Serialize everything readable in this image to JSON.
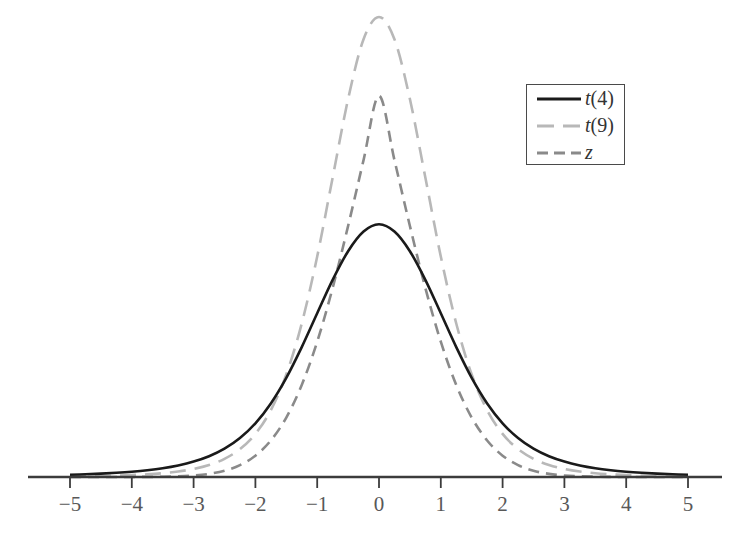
{
  "figure": {
    "background_color": "#ffffff",
    "width": 756,
    "height": 538
  },
  "axis": {
    "baseline_y": 477,
    "line_start_x": 28,
    "line_end_x": 722,
    "color": "#3c3c3c",
    "tick_length": 11,
    "tick_labels": [
      "−5",
      "−4",
      "−3",
      "−2",
      "−1",
      "0",
      "1",
      "2",
      "3",
      "4",
      "5"
    ],
    "tick_values": [
      -5,
      -4,
      -3,
      -2,
      -1,
      0,
      1,
      2,
      3,
      4,
      5
    ],
    "label_color": "#585858"
  },
  "legend": {
    "position": "upper-right",
    "border_color": "#4a4a4a",
    "entries": [
      {
        "label_main": "t",
        "label_paren": "(4)",
        "name": "t-4",
        "color": "#1a1a1a",
        "style": "solid",
        "width": 2.6
      },
      {
        "label_main": "t",
        "label_paren": "(9)",
        "name": "t-9",
        "color": "#b8b8b8",
        "style": "dashed-long",
        "width": 2.6
      },
      {
        "label_main": "z",
        "label_paren": "",
        "name": "z",
        "color": "#8a8a8a",
        "style": "dashed-short",
        "width": 2.6
      }
    ]
  },
  "chart_data": {
    "type": "line",
    "title": "",
    "subtitle": "",
    "xlabel": "",
    "ylabel": "",
    "xlim": [
      -5,
      5
    ],
    "ylim": [
      0,
      0.42
    ],
    "grid": false,
    "legend_position": "upper right",
    "x_tick_labels": [
      "−5",
      "−4",
      "−3",
      "−2",
      "−1",
      "0",
      "1",
      "2",
      "3",
      "4",
      "5"
    ],
    "x": [
      -5,
      -4.75,
      -4.5,
      -4.25,
      -4,
      -3.75,
      -3.5,
      -3.25,
      -3,
      -2.75,
      -2.5,
      -2.25,
      -2,
      -1.75,
      -1.5,
      -1.25,
      -1,
      -0.75,
      -0.5,
      -0.25,
      0,
      0.25,
      0.5,
      0.75,
      1,
      1.25,
      1.5,
      1.75,
      2,
      2.25,
      2.5,
      2.75,
      3,
      3.25,
      3.5,
      3.75,
      4,
      4.25,
      4.5,
      4.75,
      5
    ],
    "series": [
      {
        "name": "t(4)",
        "color": "#1a1a1a",
        "style": "solid",
        "df": 4,
        "peak": 0.375,
        "values": [
          0.00511,
          0.00626,
          0.00774,
          0.00968,
          0.01224,
          0.01567,
          0.02031,
          0.02668,
          0.03551,
          0.04785,
          0.06524,
          0.08985,
          0.12395,
          0.16983,
          0.22883,
          0.29978,
          0.37789,
          0.45502,
          0.52109,
          0.56644,
          0.58324,
          0.56644,
          0.52109,
          0.45502,
          0.37789,
          0.29978,
          0.22883,
          0.16983,
          0.12395,
          0.08985,
          0.06524,
          0.04785,
          0.03551,
          0.02668,
          0.02031,
          0.01567,
          0.01224,
          0.00968,
          0.00774,
          0.00626,
          0.00511
        ]
      },
      {
        "name": "t(9)",
        "color": "#b8b8b8",
        "style": "dashed-long",
        "df": 9,
        "peak": 0.388,
        "values": [
          0.00134,
          0.00177,
          0.00237,
          0.00322,
          0.00443,
          0.00619,
          0.00878,
          0.01266,
          0.01856,
          0.02768,
          0.04193,
          0.06432,
          0.09951,
          0.15421,
          0.23668,
          0.35431,
          0.50892,
          0.69119,
          0.87227,
          1.01041,
          1.06171,
          1.01041,
          0.87227,
          0.69119,
          0.50892,
          0.35431,
          0.23668,
          0.15421,
          0.09951,
          0.06432,
          0.04193,
          0.02768,
          0.01856,
          0.01266,
          0.00878,
          0.00619,
          0.00443,
          0.00322,
          0.00237,
          0.00177,
          0.00134
        ]
      },
      {
        "name": "z",
        "color": "#8a8a8a",
        "style": "dashed-short",
        "peak": 0.399,
        "values": [
          1.5e-06,
          4.7e-06,
          1.41e-05,
          4.01e-05,
          0.000108,
          0.000277,
          0.000676,
          0.001568,
          0.003456,
          0.007246,
          0.014446,
          0.027368,
          0.049261,
          0.084363,
          0.137234,
          0.212404,
          0.312254,
          0.436457,
          0.579383,
          0.731436,
          0.879844,
          0.731436,
          0.579383,
          0.436457,
          0.312254,
          0.212404,
          0.137234,
          0.084363,
          0.049261,
          0.027368,
          0.014446,
          0.007246,
          0.003456,
          0.001568,
          0.000676,
          0.000277,
          0.000108,
          4.01e-05,
          1.41e-05,
          4.7e-06,
          1.5e-06
        ]
      }
    ]
  }
}
